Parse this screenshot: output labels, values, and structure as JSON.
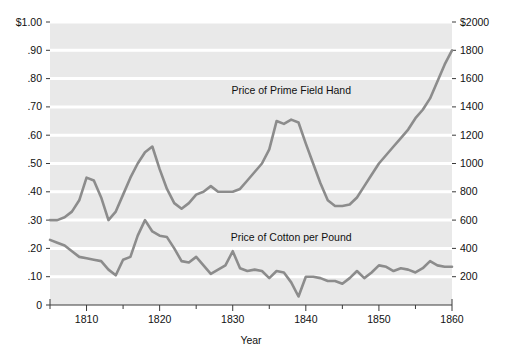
{
  "chart_data": {
    "type": "line",
    "title": "",
    "xlabel": "Year",
    "ylabel": "",
    "xlim": [
      1805,
      1860
    ],
    "left_axis": {
      "label": "",
      "ylim": [
        0,
        1.0
      ],
      "ticks": [
        0,
        0.1,
        0.2,
        0.3,
        0.4,
        0.5,
        0.6,
        0.7,
        0.8,
        0.9,
        1.0
      ],
      "tick_labels": [
        "0",
        ".10",
        ".20",
        ".30",
        ".40",
        ".50",
        ".60",
        ".70",
        ".80",
        ".90",
        "$1.00"
      ]
    },
    "right_axis": {
      "label": "",
      "ylim": [
        0,
        2000
      ],
      "ticks": [
        200,
        400,
        600,
        800,
        1000,
        1200,
        1400,
        1600,
        1800,
        2000
      ],
      "tick_labels": [
        "200",
        "400",
        "600",
        "800",
        "1000",
        "1200",
        "1400",
        "1600",
        "1800",
        "$2000"
      ]
    },
    "x_ticks_major": [
      1810,
      1820,
      1830,
      1840,
      1850,
      1860
    ],
    "x_tick_labels": [
      "1810",
      "1820",
      "1830",
      "1840",
      "1850",
      "1860"
    ],
    "x_ticks_minor": [
      1805,
      1815,
      1825,
      1835,
      1845,
      1855
    ],
    "grid": "horizontal-white",
    "legend": "inline-annotations",
    "series": [
      {
        "name": "Price of Prime Field Hand",
        "axis": "right",
        "unit": "dollars",
        "annotation": "Price of Prime Field Hand",
        "annotation_x": 1838,
        "annotation_y": 0.745,
        "color": "#8c8c8c",
        "x": [
          1805,
          1806,
          1807,
          1808,
          1809,
          1810,
          1811,
          1812,
          1813,
          1814,
          1815,
          1816,
          1817,
          1818,
          1819,
          1820,
          1821,
          1822,
          1823,
          1824,
          1825,
          1826,
          1827,
          1828,
          1829,
          1830,
          1831,
          1832,
          1833,
          1834,
          1835,
          1836,
          1837,
          1838,
          1839,
          1840,
          1841,
          1842,
          1843,
          1844,
          1845,
          1846,
          1847,
          1848,
          1849,
          1850,
          1851,
          1852,
          1853,
          1854,
          1855,
          1856,
          1857,
          1858,
          1859,
          1860
        ],
        "values_left_scale": [
          0.3,
          0.3,
          0.31,
          0.33,
          0.37,
          0.45,
          0.44,
          0.38,
          0.3,
          0.33,
          0.39,
          0.45,
          0.5,
          0.54,
          0.56,
          0.48,
          0.41,
          0.36,
          0.34,
          0.36,
          0.39,
          0.4,
          0.42,
          0.4,
          0.4,
          0.4,
          0.41,
          0.44,
          0.47,
          0.5,
          0.55,
          0.65,
          0.64,
          0.655,
          0.645,
          0.57,
          0.5,
          0.43,
          0.37,
          0.35,
          0.35,
          0.355,
          0.38,
          0.42,
          0.46,
          0.5,
          0.53,
          0.56,
          0.59,
          0.62,
          0.66,
          0.69,
          0.73,
          0.79,
          0.85,
          0.9
        ],
        "values_dollars": [
          600,
          600,
          620,
          660,
          740,
          900,
          880,
          760,
          600,
          660,
          780,
          900,
          1000,
          1080,
          1120,
          960,
          820,
          720,
          680,
          720,
          780,
          800,
          840,
          800,
          800,
          800,
          820,
          880,
          940,
          1000,
          1100,
          1300,
          1280,
          1310,
          1290,
          1140,
          1000,
          860,
          740,
          700,
          700,
          710,
          760,
          840,
          920,
          1000,
          1060,
          1120,
          1180,
          1240,
          1320,
          1380,
          1460,
          1580,
          1700,
          1800
        ]
      },
      {
        "name": "Price of Cotton per Pound",
        "axis": "left",
        "unit": "dollars per pound",
        "annotation": "Price of Cotton per Pound",
        "annotation_x": 1838,
        "annotation_y": 0.225,
        "color": "#8c8c8c",
        "x": [
          1805,
          1806,
          1807,
          1808,
          1809,
          1810,
          1811,
          1812,
          1813,
          1814,
          1815,
          1816,
          1817,
          1818,
          1819,
          1820,
          1821,
          1822,
          1823,
          1824,
          1825,
          1826,
          1827,
          1828,
          1829,
          1830,
          1831,
          1832,
          1833,
          1834,
          1835,
          1836,
          1837,
          1838,
          1839,
          1840,
          1841,
          1842,
          1843,
          1844,
          1845,
          1846,
          1847,
          1848,
          1849,
          1850,
          1851,
          1852,
          1853,
          1854,
          1855,
          1856,
          1857,
          1858,
          1859,
          1860
        ],
        "values": [
          0.23,
          0.22,
          0.21,
          0.19,
          0.17,
          0.165,
          0.16,
          0.155,
          0.125,
          0.105,
          0.16,
          0.17,
          0.245,
          0.3,
          0.26,
          0.245,
          0.24,
          0.2,
          0.155,
          0.15,
          0.17,
          0.14,
          0.11,
          0.125,
          0.14,
          0.19,
          0.13,
          0.12,
          0.125,
          0.12,
          0.095,
          0.12,
          0.115,
          0.08,
          0.03,
          0.1,
          0.1,
          0.095,
          0.085,
          0.085,
          0.075,
          0.095,
          0.12,
          0.095,
          0.115,
          0.14,
          0.135,
          0.12,
          0.13,
          0.125,
          0.115,
          0.13,
          0.155,
          0.14,
          0.135,
          0.135
        ]
      }
    ],
    "colors": {
      "plot_background": "#e9e9e9",
      "gridline": "#ffffff",
      "line": "#8c8c8c",
      "axis": "#3a3a3a",
      "text": "#111111"
    }
  }
}
